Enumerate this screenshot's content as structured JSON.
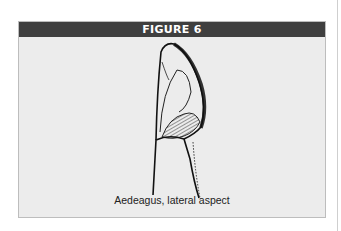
{
  "figure": {
    "title": "FIGURE 6",
    "caption": "Aedeagus, lateral aspect",
    "illustration": "aedeagus-lateral-drawing"
  },
  "colors": {
    "header_bg": "#3f3f3f",
    "header_text": "#ffffff",
    "panel_bg": "#ececec",
    "border": "#bdbdbd"
  }
}
